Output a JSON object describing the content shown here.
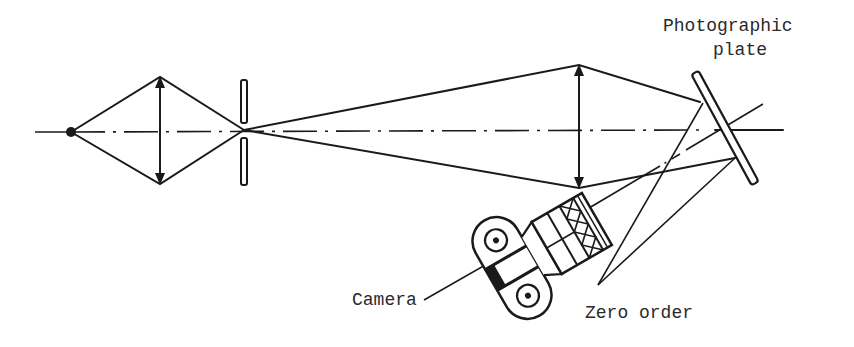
{
  "figure": {
    "type": "optical-schematic",
    "labels": {
      "plate_line1": "Photographic",
      "plate_line2": "plate",
      "camera": "Camera",
      "zero_order": "Zero order"
    },
    "components": [
      {
        "name": "point-source",
        "x": 71,
        "y": 132
      },
      {
        "name": "first-lens",
        "x": 160,
        "y_top": 77,
        "y_bottom": 184
      },
      {
        "name": "slit",
        "x": 244,
        "y_top": 80,
        "y_bottom": 185
      },
      {
        "name": "second-lens",
        "x": 579,
        "y_top": 65,
        "y_bottom": 188
      },
      {
        "name": "photographic-plate",
        "x1": 695,
        "y1": 72,
        "x2": 755,
        "y2": 183
      },
      {
        "name": "camera",
        "cx": 515,
        "cy": 268,
        "rotation_deg": -30
      }
    ],
    "colors": {
      "ink": "#1a1a1a",
      "background": "#ffffff"
    }
  }
}
